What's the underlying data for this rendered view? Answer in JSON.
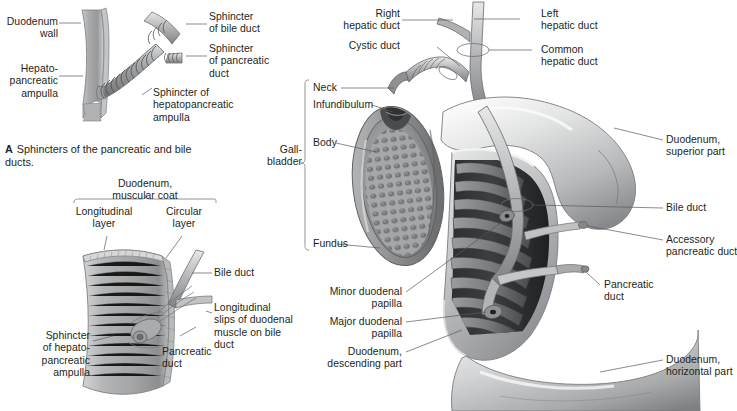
{
  "figure": {
    "title_present": false,
    "panels": [
      {
        "id": "A",
        "caption_letter": "A",
        "caption_text": "Sphincters of the pancreatic and bile ducts."
      }
    ],
    "colors": {
      "text": "#231f20",
      "leader_line": "#58595b",
      "bracket": "#6d6e71",
      "background": "#ffffff",
      "tissue_light": "#d9d9d9",
      "tissue_mid": "#a7a9ac",
      "tissue_dark": "#6d6e71",
      "tissue_darkest": "#3a3a3c",
      "duct_highlight": "#e6e6e6"
    }
  },
  "panel_a": {
    "labels": {
      "duodenum_wall": "Duodenum\nwall",
      "hepatopancreatic_ampulla": "Hepato-\npancreatic\nampulla",
      "sphincter_bile_duct": "Sphincter\nof bile duct",
      "sphincter_pancreatic_duct": "Sphincter\nof pancreatic\nduct",
      "sphincter_hepatopancreatic_ampulla": "Sphincter of\nhepatopancreatic\nampulla"
    },
    "caption_letter": "A",
    "caption_text": "Sphincters of the pancreatic and bile\nducts."
  },
  "panel_b": {
    "labels": {
      "duodenum_muscular_coat": "Duodenum,\nmuscular coat",
      "longitudinal_layer": "Longitudinal\nlayer",
      "circular_layer": "Circular\nlayer",
      "bile_duct": "Bile duct",
      "longitudinal_slips": "Longitudinal\nslips of duodenal\nmuscle on bile\nduct",
      "pancreatic_duct": "Pancreatic\nduct",
      "sphincter_of_hepatopancreatic_ampulla": "Sphincter\nof hepato-\npancreatic\nampulla"
    }
  },
  "panel_c": {
    "labels": {
      "right_hepatic_duct": "Right\nhepatic duct",
      "left_hepatic_duct": "Left\nhepatic duct",
      "cystic_duct": "Cystic duct",
      "common_hepatic_duct": "Common\nhepatic duct",
      "neck": "Neck",
      "infundibulum": "Infundibulum",
      "gallbladder": "Gall-\nbladder",
      "body": "Body",
      "fundus": "Fundus",
      "duodenum_superior_part": "Duodenum,\nsuperior part",
      "bile_duct": "Bile duct",
      "accessory_pancreatic_duct": "Accessory\npancreatic duct",
      "pancreatic_duct": "Pancreatic\nduct",
      "minor_duodenal_papilla": "Minor duodenal\npapilla",
      "major_duodenal_papilla": "Major duodenal\npapilla",
      "duodenum_descending_part": "Duodenum,\ndescending part",
      "duodenum_horizontal_part": "Duodenum,\nhorizontal part"
    }
  }
}
